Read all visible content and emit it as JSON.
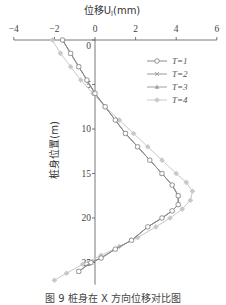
{
  "chart_data": {
    "type": "line",
    "xlabel": "位移U_l(mm)",
    "ylabel": "桩身位置(m)",
    "xlim": [
      -4,
      6
    ],
    "ylim": [
      0,
      27
    ],
    "y_inverted": true,
    "x_axis_position": "top",
    "xticks": [
      -4,
      -2,
      0,
      2,
      4,
      6
    ],
    "yticks": [
      0,
      5,
      10,
      15,
      20,
      25
    ],
    "grid": false,
    "legend_position": "upper right",
    "series": [
      {
        "name": "T=1",
        "marker": "circle",
        "color": "#8a8a8a",
        "x": [
          -1.6,
          -1.2,
          -0.8,
          -0.4,
          0.0,
          0.5,
          1.0,
          1.5,
          2.1,
          2.7,
          3.3,
          3.8,
          4.1,
          4.1,
          3.8,
          3.3,
          2.6,
          1.8,
          1.0,
          0.3,
          -0.2,
          -0.8
        ],
        "y": [
          0,
          1.5,
          3,
          4.5,
          6,
          7.5,
          9,
          10.5,
          12,
          13.5,
          15,
          16.3,
          17.5,
          18.5,
          19.2,
          20,
          21,
          22.5,
          23.5,
          24.5,
          25,
          26
        ]
      },
      {
        "name": "T=2",
        "marker": "x",
        "color": "#9a9a9a",
        "x": [
          -1.6,
          -1.2,
          -0.8,
          -0.4,
          0.0,
          0.5,
          1.0,
          1.5,
          2.1,
          2.7,
          3.3,
          3.8,
          4.1,
          4.1,
          3.8,
          3.3,
          2.6,
          1.8,
          1.0,
          0.3,
          -0.2,
          -0.8
        ],
        "y": [
          0,
          1.5,
          3,
          4.5,
          6,
          7.5,
          9,
          10.5,
          12,
          13.5,
          15,
          16.3,
          17.5,
          18.5,
          19.2,
          20,
          21,
          22.5,
          23.5,
          24.5,
          25,
          26
        ]
      },
      {
        "name": "T=3",
        "marker": "triangle",
        "color": "#a0a0a0",
        "x": [
          -1.6,
          -1.2,
          -0.8,
          -0.4,
          0.0,
          0.5,
          1.0,
          1.5,
          2.1,
          2.7,
          3.3,
          3.8,
          4.1,
          4.1,
          3.8,
          3.3,
          2.6,
          1.8,
          1.0,
          0.3,
          -0.2,
          -0.8
        ],
        "y": [
          0,
          1.5,
          3,
          4.5,
          6,
          7.5,
          9,
          10.5,
          12,
          13.5,
          15,
          16.3,
          17.5,
          18.5,
          19.2,
          20,
          21,
          22.5,
          23.5,
          24.5,
          25,
          26
        ]
      },
      {
        "name": "T=4",
        "marker": "diamond",
        "color": "#c8c8c8",
        "x": [
          -2.1,
          -1.7,
          -1.2,
          -0.7,
          -0.1,
          0.5,
          1.2,
          1.9,
          2.6,
          3.3,
          4.0,
          4.5,
          4.8,
          4.7,
          4.3,
          3.7,
          3.0,
          2.1,
          1.2,
          0.3,
          -0.6,
          -1.4,
          -2.0
        ],
        "y": [
          0,
          1.5,
          3,
          4.5,
          6,
          7.5,
          9,
          10.5,
          12,
          13.5,
          15,
          16,
          17,
          18,
          19,
          20,
          21,
          22.2,
          23.2,
          24.2,
          25.2,
          26.2,
          27
        ]
      }
    ]
  },
  "axes": {
    "title": "位移U",
    "title_sub": "l",
    "title_unit": "(mm)",
    "ylabel": "桩身位置(m)",
    "xticks": [
      "−4",
      "−2",
      "0",
      "2",
      "4",
      "6"
    ],
    "yticks": [
      "0",
      "5",
      "10",
      "15",
      "20",
      "25"
    ]
  },
  "legend": [
    "T=1",
    "T=2",
    "T=3",
    "T=4"
  ],
  "caption": "图 9   桩身在 X 方向位移对比图"
}
